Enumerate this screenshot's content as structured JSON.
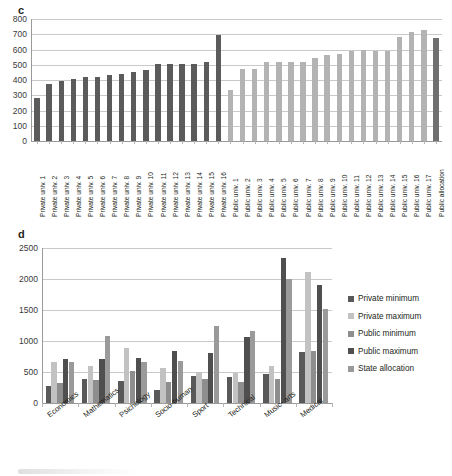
{
  "figure": {
    "panels": [
      {
        "letter": "c"
      },
      {
        "letter": "d"
      }
    ]
  },
  "chart_data": [
    {
      "type": "bar",
      "panel": "c",
      "title": "",
      "xlabel": "",
      "ylabel": "",
      "ylim": [
        0,
        800
      ],
      "yticks": [
        0,
        100,
        200,
        300,
        400,
        500,
        600,
        700,
        800
      ],
      "grid": true,
      "legend": "none",
      "colors": {
        "private": "#5b5b5b",
        "public": "#b3b3b3",
        "allocation": "#6f6f6f"
      },
      "categories": [
        "Private univ. 1",
        "Private univ. 2",
        "Private univ. 3",
        "Private univ. 4",
        "Private univ. 5",
        "Private univ. 6",
        "Private univ. 7",
        "Private univ. 8",
        "Private univ. 9",
        "Private univ. 10",
        "Private univ. 11",
        "Private univ. 12",
        "Private univ. 13",
        "Private univ. 14",
        "Private univ. 15",
        "Private univ. 16",
        "Public univ. 1",
        "Public univ. 2",
        "Public univ. 3",
        "Public univ. 4",
        "Public univ. 5",
        "Public univ. 6",
        "Public univ. 7",
        "Public univ. 8",
        "Public univ. 9",
        "Public univ. 10",
        "Public univ. 11",
        "Public univ. 12",
        "Public univ. 13",
        "Public univ. 14",
        "Public univ. 15",
        "Public univ. 16",
        "Public univ. 17",
        "Public allocation"
      ],
      "values": [
        280,
        372,
        392,
        408,
        418,
        420,
        432,
        442,
        452,
        468,
        505,
        504,
        506,
        506,
        517,
        695,
        333,
        470,
        470,
        516,
        518,
        516,
        518,
        542,
        566,
        568,
        592,
        594,
        593,
        593,
        681,
        714,
        729,
        674
      ],
      "group_of": [
        "private",
        "private",
        "private",
        "private",
        "private",
        "private",
        "private",
        "private",
        "private",
        "private",
        "private",
        "private",
        "private",
        "private",
        "private",
        "private",
        "public",
        "public",
        "public",
        "public",
        "public",
        "public",
        "public",
        "public",
        "public",
        "public",
        "public",
        "public",
        "public",
        "public",
        "public",
        "public",
        "public",
        "allocation"
      ]
    },
    {
      "type": "bar",
      "panel": "d",
      "title": "",
      "xlabel": "",
      "ylabel": "",
      "ylim": [
        0,
        2500
      ],
      "yticks": [
        0,
        500,
        1000,
        1500,
        2000,
        2500
      ],
      "grid": true,
      "legend_position": "right",
      "categories": [
        "Economics",
        "Mathematics",
        "Psichology",
        "Socio-human",
        "Sport",
        "Technical",
        "Music- arts",
        "Medical"
      ],
      "series": [
        {
          "name": "Private minimum",
          "color": "#595959",
          "values": [
            275,
            393,
            352,
            208,
            430,
            423,
            470,
            830
          ]
        },
        {
          "name": "Private maximum",
          "color": "#c2c2c2",
          "values": [
            655,
            590,
            895,
            563,
            505,
            483,
            597,
            2120
          ]
        },
        {
          "name": "Public minimum",
          "color": "#8e8e8e",
          "values": [
            322,
            365,
            512,
            332,
            380,
            345,
            385,
            835
          ]
        },
        {
          "name": "Public maximum",
          "color": "#4f4f4f",
          "values": [
            712,
            715,
            722,
            845,
            810,
            1060,
            2345,
            1908
          ]
        },
        {
          "name": "State allocation",
          "color": "#9a9a9a",
          "values": [
            655,
            1085,
            655,
            672,
            1243,
            1168,
            2000,
            1512
          ]
        }
      ]
    }
  ]
}
